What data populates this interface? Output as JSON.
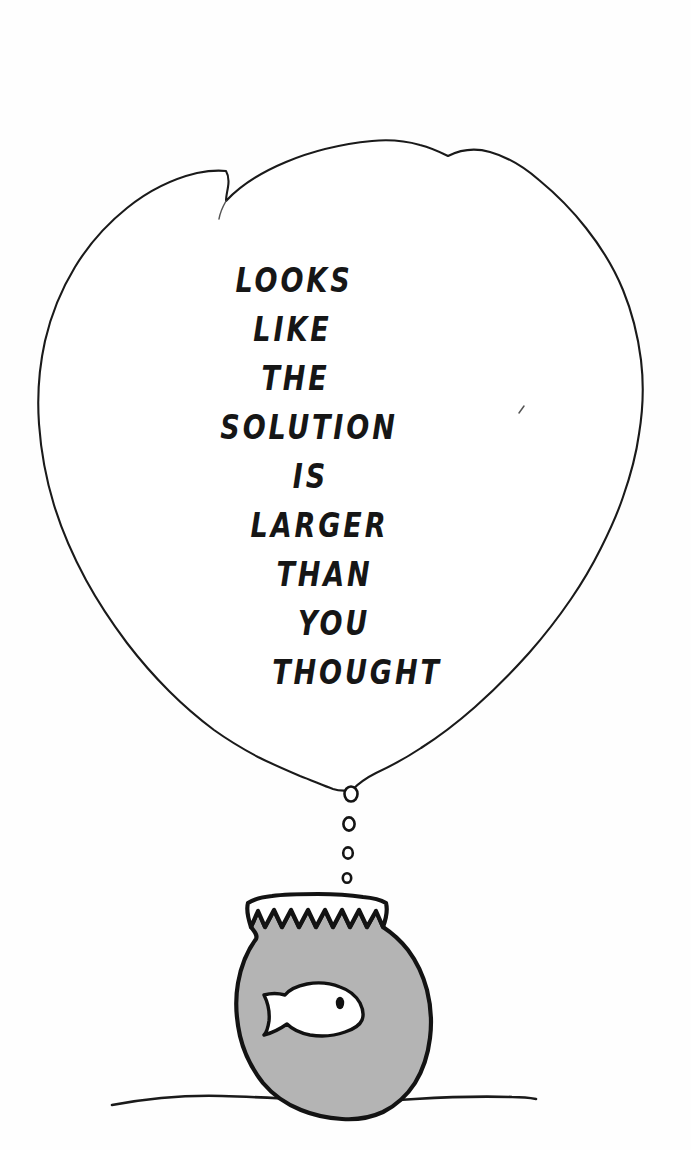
{
  "artwork": {
    "kind": "single-panel-cartoon",
    "medium": "pen-and-ink-line-drawing",
    "background_color": "#fefefe",
    "ink_color": "#161616",
    "water_color": "#b4b4b4",
    "fish_color": "#ffffff"
  },
  "caption": {
    "full_text": "LOOKS LIKE THE SOLUTION IS LARGER THAN YOU THOUGHT",
    "lines": [
      "LOOKS",
      "LIKE",
      "THE",
      "SOLUTION",
      "IS",
      "LARGER",
      "THAN",
      "YOU",
      "THOUGHT"
    ]
  },
  "elements": {
    "thought_cloud_label": "thought cloud",
    "bubble_trail_label": "thought bubble trail",
    "bubble_count": 4,
    "fishbowl_label": "fishbowl",
    "fish_label": "goldfish",
    "ground_label": "ground line"
  }
}
